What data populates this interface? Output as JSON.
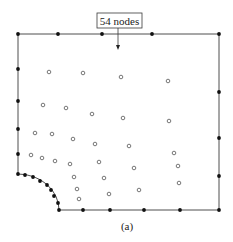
{
  "figure": {
    "callout_label": "54 nodes",
    "caption": "(a)",
    "colors": {
      "stroke": "#3a3a3a",
      "boundary_node": "#111111",
      "interior_node_stroke": "#555555",
      "background": "#ffffff"
    },
    "domain_outline": {
      "description": "Rectangle with quarter-circle cutout at bottom-left corner",
      "top_y": 34,
      "bottom_y": 210,
      "left_x": 18,
      "right_x": 219,
      "arc_start": [
        18,
        174
      ],
      "arc_end": [
        59,
        210
      ]
    },
    "boundary_nodes": [
      [
        18,
        34
      ],
      [
        58,
        34
      ],
      [
        102,
        34
      ],
      [
        152,
        34
      ],
      [
        219,
        34
      ],
      [
        18,
        69
      ],
      [
        18,
        101
      ],
      [
        18,
        129
      ],
      [
        18,
        154
      ],
      [
        18,
        174
      ],
      [
        219,
        92
      ],
      [
        219,
        138
      ],
      [
        219,
        176
      ],
      [
        25,
        175
      ],
      [
        33,
        177
      ],
      [
        40,
        181
      ],
      [
        47,
        185
      ],
      [
        51,
        190
      ],
      [
        54,
        196
      ],
      [
        58,
        203
      ],
      [
        59,
        210
      ],
      [
        83,
        210
      ],
      [
        110,
        210
      ],
      [
        144,
        210
      ],
      [
        180,
        210
      ],
      [
        219,
        210
      ]
    ],
    "interior_nodes": [
      [
        49,
        72
      ],
      [
        83,
        73
      ],
      [
        121,
        77
      ],
      [
        168,
        81
      ],
      [
        43,
        105
      ],
      [
        66,
        108
      ],
      [
        92,
        114
      ],
      [
        123,
        118
      ],
      [
        169,
        121
      ],
      [
        35,
        133
      ],
      [
        52,
        134
      ],
      [
        73,
        139
      ],
      [
        95,
        144
      ],
      [
        129,
        146
      ],
      [
        31,
        155
      ],
      [
        42,
        158
      ],
      [
        55,
        161
      ],
      [
        70,
        164
      ],
      [
        99,
        162
      ],
      [
        134,
        168
      ],
      [
        174,
        153
      ],
      [
        178,
        166
      ],
      [
        74,
        177
      ],
      [
        104,
        178
      ],
      [
        179,
        183
      ],
      [
        77,
        189
      ],
      [
        109,
        194
      ],
      [
        139,
        190
      ],
      [
        79,
        199
      ]
    ]
  }
}
